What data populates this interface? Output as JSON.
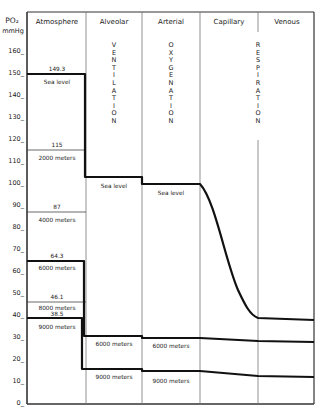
{
  "y_axis": {
    "label_line1": "PO₂",
    "label_line2": "mmHg",
    "ticks": [
      {
        "label": "160_",
        "value": 160
      },
      {
        "label": "150_",
        "value": 150
      },
      {
        "label": "140_",
        "value": 140
      },
      {
        "label": "130_",
        "value": 130
      },
      {
        "label": "120_",
        "value": 120
      },
      {
        "label": "110_",
        "value": 110
      },
      {
        "label": "100_",
        "value": 100
      },
      {
        "label": "90_",
        "value": 90
      },
      {
        "label": "80_",
        "value": 80
      },
      {
        "label": "70_",
        "value": 70
      },
      {
        "label": "60_",
        "value": 60
      },
      {
        "label": "50_",
        "value": 50
      },
      {
        "label": "40_",
        "value": 40
      },
      {
        "label": "30_",
        "value": 30
      },
      {
        "label": "20_",
        "value": 20
      },
      {
        "label": "10_",
        "value": 10
      },
      {
        "label": "0_",
        "value": 0
      }
    ]
  },
  "columns": [
    {
      "label": "Atmosphere"
    },
    {
      "label": "Alveolar"
    },
    {
      "label": "Arterial"
    },
    {
      "label": "Capillary"
    },
    {
      "label": "Venous"
    }
  ],
  "processes": {
    "ventilation": "VENTILATION",
    "oxygenation": "OXYGENATION",
    "respiration": "RESPIRATION"
  },
  "atmosphere_levels": [
    {
      "value_label": "149.3",
      "altitude": "Sea level",
      "value": 149.3,
      "thick": true
    },
    {
      "value_label": "115",
      "altitude": "2000 meters",
      "value": 115,
      "thick": false
    },
    {
      "value_label": "87",
      "altitude": "4000 meters",
      "value": 87,
      "thick": false
    },
    {
      "value_label": "64.3",
      "altitude": "6000 meters",
      "value": 64.3,
      "thick": true
    },
    {
      "value_label": "46.1",
      "altitude": "8000 meters",
      "value": 46.1,
      "thick": false
    },
    {
      "value_label": "38.5",
      "altitude": "9000 meters",
      "value": 38.5,
      "thick": true
    }
  ],
  "alveolar_labels": {
    "sea_level": "Sea level",
    "m6000": "6000 meters",
    "m9000": "9000 meters"
  },
  "arterial_labels": {
    "sea_level": "Sea level",
    "m6000": "6000 meters",
    "m9000": "9000 meters"
  },
  "chart_data": {
    "type": "line",
    "ylabel": "PO2 mmHg",
    "ylim": [
      0,
      160
    ],
    "categories": [
      "Atmosphere",
      "Alveolar",
      "Arterial",
      "Capillary",
      "Venous"
    ],
    "series": [
      {
        "name": "Sea level",
        "values": [
          149.3,
          102,
          99,
          40,
          38
        ]
      },
      {
        "name": "6000 meters",
        "values": [
          64.3,
          30,
          29,
          28,
          27
        ]
      },
      {
        "name": "9000 meters",
        "values": [
          38.5,
          15,
          14,
          12,
          12
        ]
      }
    ],
    "atmosphere_reference_lines": [
      {
        "altitude": "2000 meters",
        "value": 115
      },
      {
        "altitude": "4000 meters",
        "value": 87
      },
      {
        "altitude": "8000 meters",
        "value": 46.1
      }
    ],
    "grid": false
  }
}
